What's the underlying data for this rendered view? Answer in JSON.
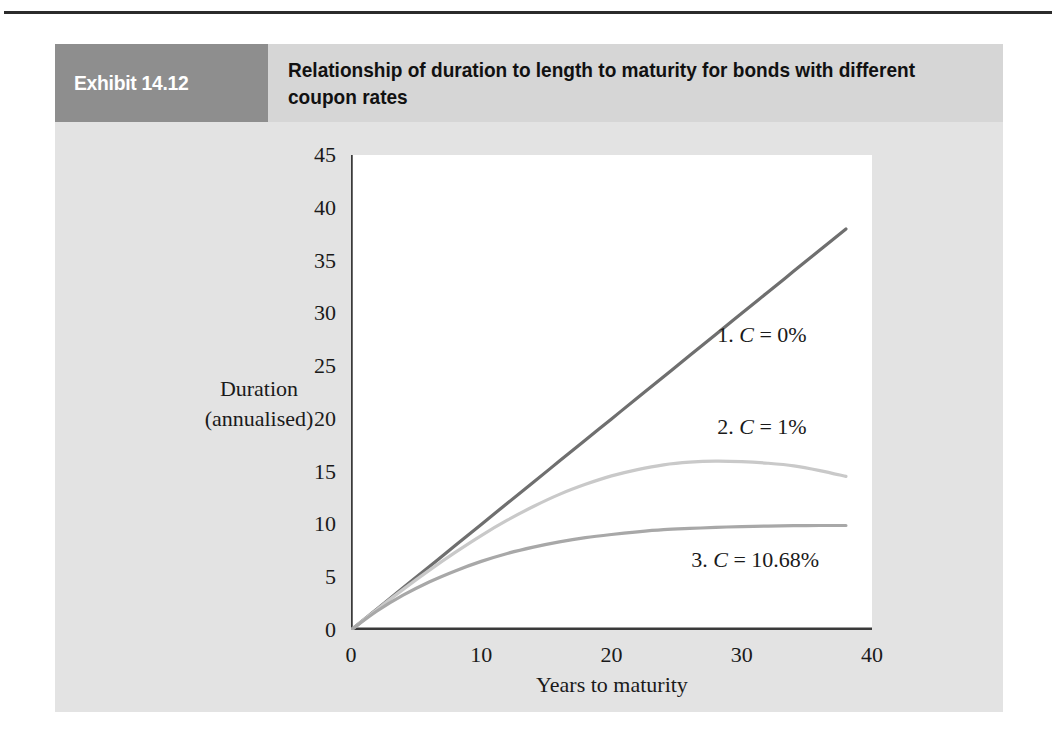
{
  "exhibit": {
    "tag": "Exhibit 14.12",
    "title": "Relationship of duration to length to maturity for bonds with different coupon rates"
  },
  "colors": {
    "tag_bg": "#8e8e8e",
    "header_bg": "#d6d6d6",
    "panel_bg": "#e3e3e3",
    "plot_bg": "#ffffff",
    "axis": "#3a3a3a",
    "series1": "#6f6f6f",
    "series2": "#c9c9c9",
    "series3": "#a8a8a8"
  },
  "chart_data": {
    "type": "line",
    "title": "Relationship of duration to length to maturity for bonds with different coupon rates",
    "xlabel": "Years to maturity",
    "ylabel": "Duration (annualised)",
    "ylabel_line1": "Duration",
    "ylabel_line2": "(annualised)",
    "xlim": [
      0,
      40
    ],
    "ylim": [
      0,
      45
    ],
    "xticks": [
      "0",
      "10",
      "20",
      "30",
      "40"
    ],
    "xtick_values": [
      0,
      10,
      20,
      30,
      40
    ],
    "yticks": [
      "0",
      "5",
      "10",
      "15",
      "20",
      "25",
      "30",
      "35",
      "40",
      "45"
    ],
    "ytick_values": [
      0,
      5,
      10,
      15,
      20,
      25,
      30,
      35,
      40,
      45
    ],
    "grid": false,
    "legend": "inline-annotations",
    "x": [
      0,
      2,
      4,
      6,
      8,
      10,
      12,
      14,
      16,
      18,
      20,
      22,
      24,
      26,
      28,
      30,
      32,
      34,
      36,
      38
    ],
    "series": [
      {
        "name": "1. C = 0%",
        "label_text": "1. C = 0%",
        "label_prefix": "1. ",
        "label_var": "C",
        "label_suffix": " = 0%",
        "color": "#6f6f6f",
        "values": [
          0,
          2.0,
          4.0,
          6.0,
          8.0,
          10.0,
          12.0,
          14.0,
          16.0,
          18.0,
          20.0,
          22.0,
          24.0,
          26.0,
          28.0,
          30.0,
          32.0,
          34.0,
          36.0,
          38.0
        ]
      },
      {
        "name": "2. C = 1%",
        "label_text": "2. C = 1%",
        "label_prefix": "2. ",
        "label_var": "C",
        "label_suffix": " = 1%",
        "color": "#c9c9c9",
        "values": [
          0,
          1.95,
          3.85,
          5.65,
          7.35,
          8.95,
          10.4,
          11.7,
          12.85,
          13.8,
          14.6,
          15.2,
          15.65,
          15.9,
          16.0,
          15.95,
          15.8,
          15.55,
          15.1,
          14.55
        ]
      },
      {
        "name": "3. C = 10.68%",
        "label_text": "3. C = 10.68%",
        "label_prefix": "3. ",
        "label_var": "C",
        "label_suffix": " = 10.68%",
        "color": "#a8a8a8",
        "values": [
          0,
          1.8,
          3.3,
          4.55,
          5.6,
          6.5,
          7.25,
          7.85,
          8.35,
          8.75,
          9.05,
          9.3,
          9.5,
          9.62,
          9.72,
          9.8,
          9.85,
          9.88,
          9.9,
          9.9
        ]
      }
    ],
    "annotations": [
      {
        "text": "1. C = 0%",
        "x": 29.5,
        "y": 28.0
      },
      {
        "text": "2. C = 1%",
        "x": 29.5,
        "y": 19.3
      },
      {
        "text": "3. C = 10.68%",
        "x": 27.5,
        "y": 6.7
      }
    ]
  }
}
